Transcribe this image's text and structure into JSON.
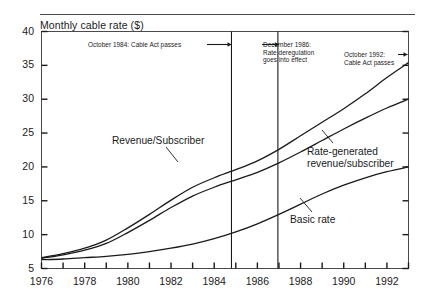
{
  "header": {
    "rule": "decorative-top-rule"
  },
  "chart_data": {
    "type": "line",
    "title": "Monthly cable rate ($)",
    "xlabel": "",
    "ylabel": "",
    "xlim": [
      1976,
      1993
    ],
    "ylim": [
      5,
      40
    ],
    "yticks": [
      5,
      10,
      15,
      20,
      25,
      30,
      35,
      40
    ],
    "ytick_labels": [
      "5",
      "10",
      "15",
      "20",
      "25",
      "30",
      "35",
      "40"
    ],
    "xticks": [
      1976,
      1977,
      1978,
      1979,
      1980,
      1981,
      1982,
      1983,
      1984,
      1985,
      1986,
      1987,
      1988,
      1989,
      1990,
      1991,
      1992,
      1993
    ],
    "xtick_labels": [
      "1976",
      "",
      "1978",
      "",
      "1980",
      "",
      "1982",
      "",
      "1984",
      "",
      "1986",
      "",
      "1988",
      "",
      "1990",
      "",
      "1992",
      ""
    ],
    "grid": false,
    "legend_position": "inline-labels",
    "series": [
      {
        "name": "Revenue/Subscriber",
        "x": [
          1976,
          1977,
          1978,
          1979,
          1980,
          1981,
          1982,
          1983,
          1984,
          1985,
          1986,
          1987,
          1988,
          1989,
          1990,
          1991,
          1992,
          1993
        ],
        "values": [
          6.6,
          7.2,
          8.0,
          9.2,
          11.0,
          13.0,
          15.1,
          17.0,
          18.4,
          19.6,
          20.9,
          22.6,
          24.6,
          26.6,
          28.6,
          30.8,
          33.2,
          35.4
        ]
      },
      {
        "name": "Rate-generated revenue/subscriber",
        "x": [
          1976,
          1977,
          1978,
          1979,
          1980,
          1981,
          1982,
          1983,
          1984,
          1985,
          1986,
          1987,
          1988,
          1989,
          1990,
          1991,
          1992,
          1993
        ],
        "values": [
          6.5,
          7.0,
          7.7,
          8.7,
          10.3,
          12.1,
          14.0,
          15.7,
          17.0,
          18.1,
          19.2,
          20.6,
          22.2,
          23.9,
          25.6,
          27.2,
          28.7,
          30.0
        ]
      },
      {
        "name": "Basic rate",
        "x": [
          1976,
          1977,
          1978,
          1979,
          1980,
          1981,
          1982,
          1983,
          1984,
          1985,
          1986,
          1987,
          1988,
          1989,
          1990,
          1991,
          1992,
          1993
        ],
        "values": [
          6.3,
          6.4,
          6.6,
          6.8,
          7.1,
          7.5,
          8.0,
          8.6,
          9.4,
          10.4,
          11.6,
          13.0,
          14.5,
          16.0,
          17.3,
          18.4,
          19.3,
          20.0
        ]
      }
    ],
    "annotations": [
      {
        "id": "oct-1984",
        "text": "October 1984: Cable Act passes",
        "event_x": 1984.8,
        "arrow": "right"
      },
      {
        "id": "dec-1986-l1",
        "text": "December 1986:",
        "event_x": 1986.95,
        "arrow": "left"
      },
      {
        "id": "dec-1986-l2",
        "text": "Rate deregulation"
      },
      {
        "id": "dec-1986-l3",
        "text": "goes into effect"
      },
      {
        "id": "oct-1992-l1",
        "text": "October 1992:",
        "event_x": 1993.0,
        "arrow": "right"
      },
      {
        "id": "oct-1992-l2",
        "text": "Cable Act passes"
      }
    ],
    "event_lines": [
      1984.8,
      1986.95
    ],
    "colors": {
      "line": "#1a1a1a",
      "axis": "#4a4a4a",
      "background": "#ffffff"
    }
  }
}
